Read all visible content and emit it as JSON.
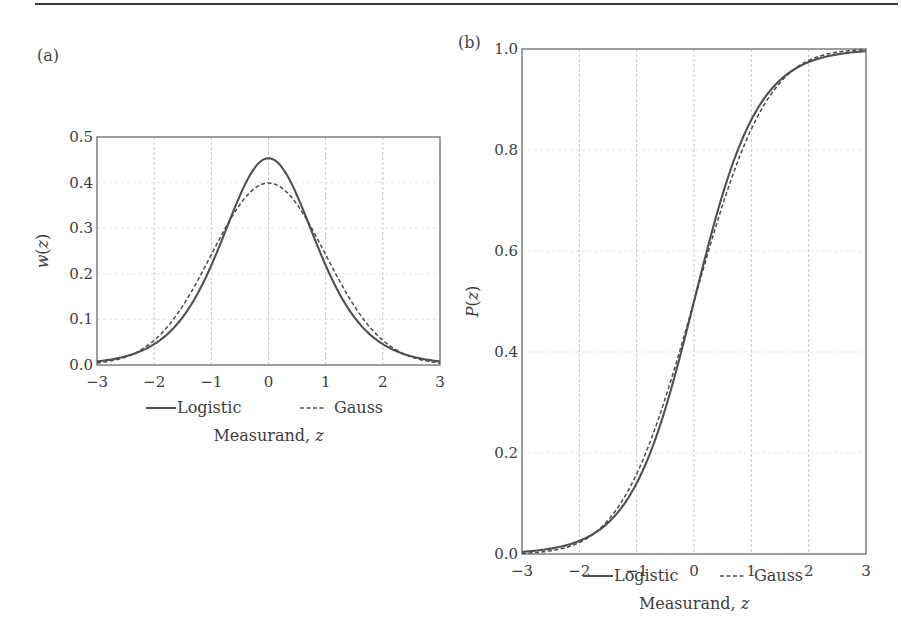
{
  "panels": {
    "a": {
      "label": "(a)"
    },
    "b": {
      "label": "(b)"
    }
  },
  "legend": {
    "logistic": "Logistic",
    "gauss": "Gauss"
  },
  "chart_data": [
    {
      "type": "line",
      "panel": "(a)",
      "title": "",
      "xlabel": "Measurand, z",
      "ylabel": "w(z)",
      "xlim": [
        -3,
        3
      ],
      "ylim": [
        0.0,
        0.5
      ],
      "xticks": [
        "-3",
        "-2",
        "-1",
        "0",
        "1",
        "2",
        "3"
      ],
      "yticks": [
        "0.0",
        "0.1",
        "0.2",
        "0.3",
        "0.4",
        "0.5"
      ],
      "grid": true,
      "legend_position": "below",
      "x": [
        -3,
        -2.5,
        -2,
        -1.5,
        -1,
        -0.5,
        0,
        0.5,
        1,
        1.5,
        2,
        2.5,
        3
      ],
      "series": [
        {
          "name": "Logistic",
          "style": "solid",
          "values": [
            0.0077,
            0.0195,
            0.0464,
            0.1118,
            0.2267,
            0.3733,
            0.4534,
            0.3733,
            0.2267,
            0.1118,
            0.0464,
            0.0195,
            0.0077
          ]
        },
        {
          "name": "Gauss",
          "style": "dashed",
          "values": [
            0.0044,
            0.0175,
            0.054,
            0.1295,
            0.242,
            0.3521,
            0.3989,
            0.3521,
            0.242,
            0.1295,
            0.054,
            0.0175,
            0.0044
          ]
        }
      ]
    },
    {
      "type": "line",
      "panel": "(b)",
      "title": "",
      "xlabel": "Measurand, z",
      "ylabel": "P(z)",
      "xlim": [
        -3,
        3
      ],
      "ylim": [
        0.0,
        1.0
      ],
      "xticks": [
        "-3",
        "-2",
        "-1",
        "0",
        "1",
        "2",
        "3"
      ],
      "yticks": [
        "0.0",
        "0.2",
        "0.4",
        "0.6",
        "0.8",
        "1.0"
      ],
      "grid": true,
      "legend_position": "below",
      "x": [
        -3,
        -2.5,
        -2,
        -1.5,
        -1,
        -0.5,
        0,
        0.5,
        1,
        1.5,
        2,
        2.5,
        3
      ],
      "series": [
        {
          "name": "Logistic",
          "style": "solid",
          "values": [
            0.0043,
            0.0109,
            0.0263,
            0.0665,
            0.1401,
            0.2824,
            0.5,
            0.7176,
            0.8599,
            0.9335,
            0.9737,
            0.9891,
            0.9957
          ]
        },
        {
          "name": "Gauss",
          "style": "dashed",
          "values": [
            0.0013,
            0.0062,
            0.0228,
            0.0668,
            0.1587,
            0.3085,
            0.5,
            0.6915,
            0.8413,
            0.9332,
            0.9772,
            0.9938,
            0.9987
          ]
        }
      ]
    }
  ]
}
